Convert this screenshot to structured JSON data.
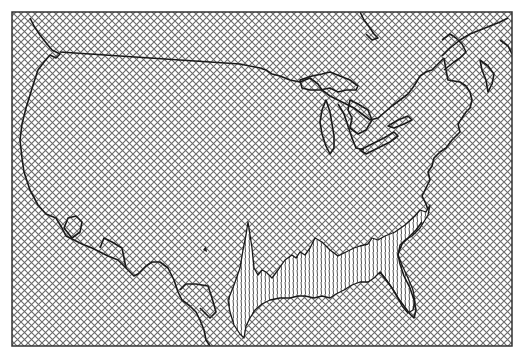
{
  "map": {
    "type": "crosshatch-surface-map",
    "region": "contiguous United States with southern Canada and northern Mexico",
    "colors": {
      "background": "#ffffff",
      "hatch": "#6a6a6a",
      "outline": "#1a1a1a",
      "frame": "#333333",
      "surface_lines": "#2a2a2a"
    },
    "frame": {
      "x": 12,
      "y": 12,
      "width": 500,
      "height": 334
    },
    "features": [
      {
        "name": "coastline-and-borders",
        "style": "solid-outline"
      },
      {
        "name": "great-lakes",
        "style": "solid-outline"
      },
      {
        "name": "us-canada-border",
        "style": "solid-outline"
      },
      {
        "name": "gulf-coast-surface",
        "style": "vertical-line-relief"
      },
      {
        "name": "background-fill",
        "style": "diagonal-crosshatch"
      }
    ]
  }
}
